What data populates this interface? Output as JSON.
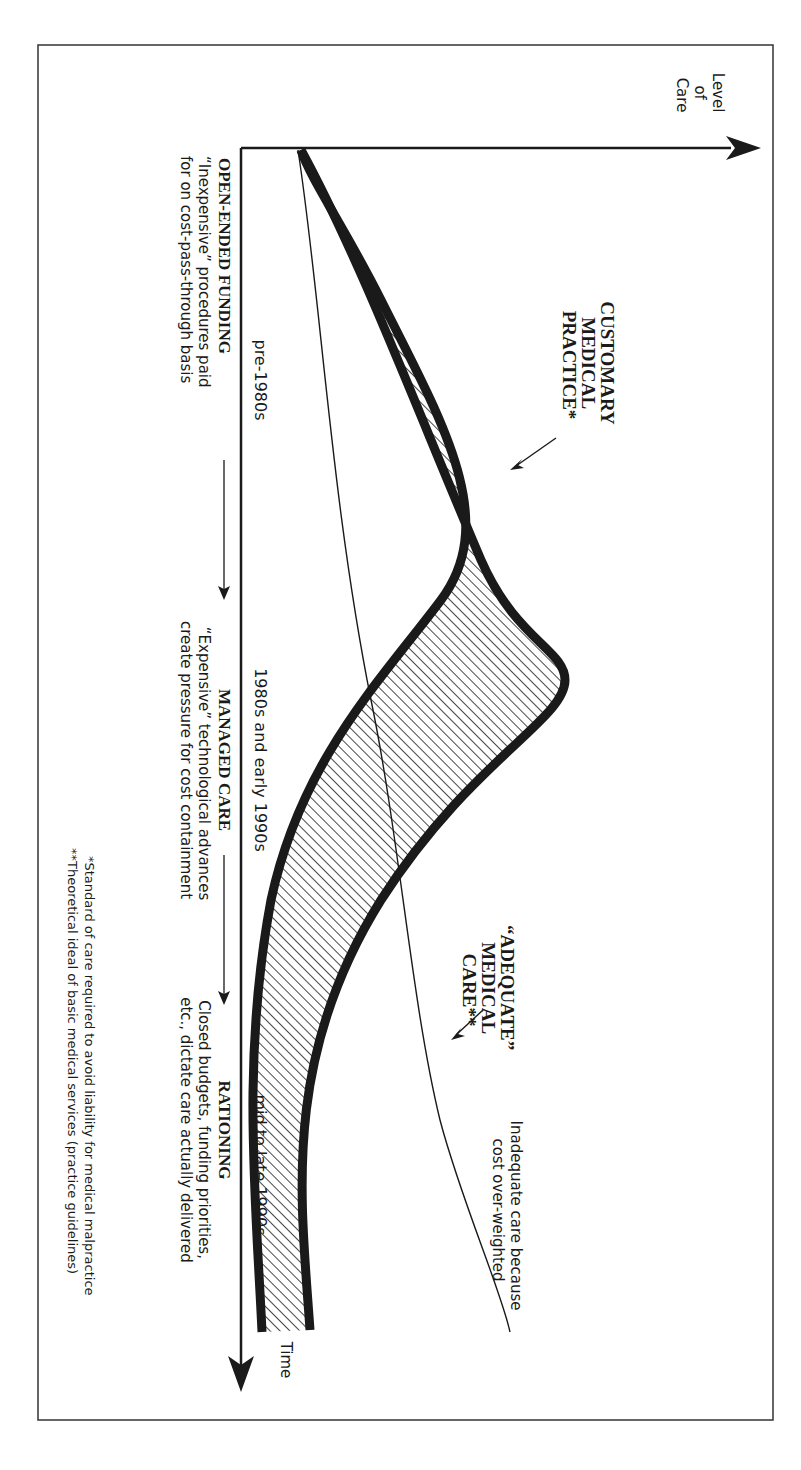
{
  "axes": {
    "y_label": [
      "Level",
      "of",
      "Care"
    ],
    "x_label": "Time"
  },
  "periods": [
    {
      "label": "pre-1980s"
    },
    {
      "label": "1980s and early 1990s"
    },
    {
      "label": "mid to late 1990s"
    }
  ],
  "phases": [
    {
      "title": "OPEN-ENDED FUNDING",
      "desc": [
        "“Inexpensive” procedures paid",
        "for on cost-pass-through basis"
      ]
    },
    {
      "title": "MANAGED CARE",
      "desc": [
        "“Expensive” technological advances",
        "create pressure for cost containment"
      ]
    },
    {
      "title": "RATIONING",
      "desc": [
        "Closed budgets, funding priorities,",
        "etc., dictate care actually delivered"
      ]
    }
  ],
  "curve_labels": {
    "customary": [
      "CUSTOMARY",
      "MEDICAL",
      "PRACTICE*"
    ],
    "adequate": [
      "“ADEQUATE”",
      "MEDICAL",
      "CARE**"
    ],
    "inadequate": [
      "Inadequate  care because",
      "cost over-weighted"
    ]
  },
  "footnotes": [
    "*Standard of care required to avoid liability for medical malpractice",
    "**Theoretical ideal of basic medical services (practice guidelines)"
  ],
  "colors": {
    "ink": "#1a1a1a",
    "background": "#ffffff"
  }
}
